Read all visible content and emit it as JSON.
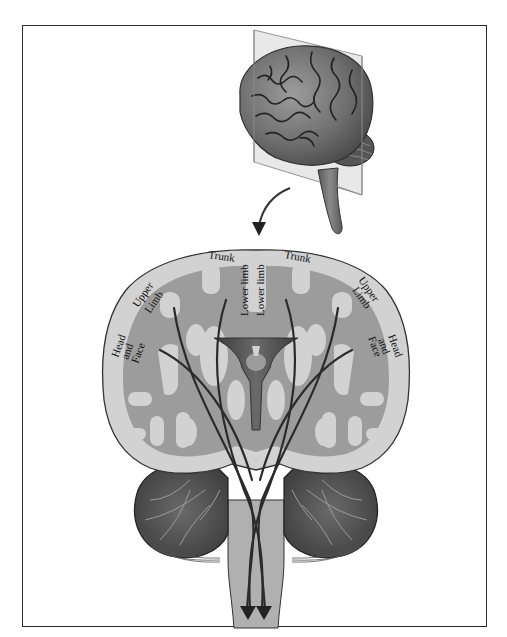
{
  "figure": {
    "type": "anatomical diagram",
    "colors": {
      "gray_matter": "#d2d2d2",
      "white_matter": "#9a9a9a",
      "tract_lines": "#2b2b2b",
      "cerebellum": "#6e6e6e",
      "brain_surface": "#7c7c7c"
    },
    "labels": {
      "left_trunk": "Trunk",
      "right_trunk": "Trunk",
      "left_lower_limb": "Lower limb",
      "right_lower_limb": "Lower limb",
      "left_upper_limb_1": "Upper",
      "left_upper_limb_2": "Limb",
      "right_upper_limb_1": "Upper",
      "right_upper_limb_2": "Limb",
      "left_head_1": "Head",
      "left_head_2": "and",
      "left_head_3": "Face",
      "right_head_1": "Head",
      "right_head_2": "and",
      "right_head_3": "Face"
    }
  }
}
